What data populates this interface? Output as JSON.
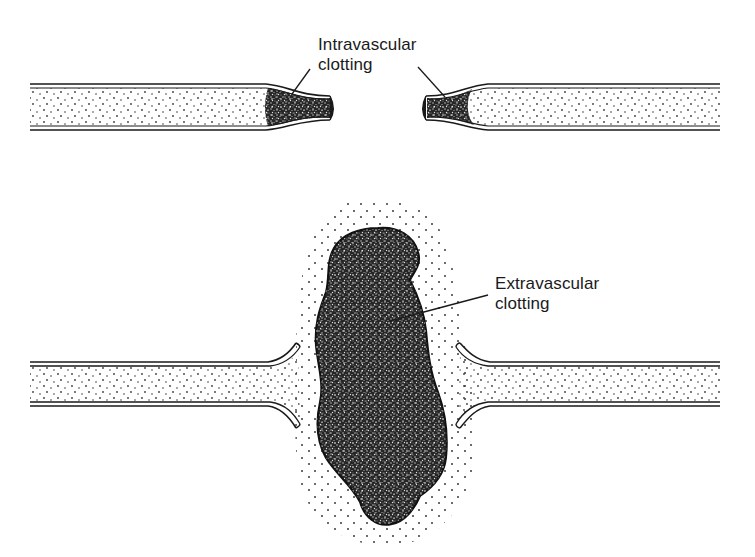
{
  "diagram": {
    "type": "medical-illustration",
    "colors": {
      "background": "#ffffff",
      "ink": "#1a1a1a",
      "clot_fill": "#2a2a2a",
      "stipple": "#444444"
    },
    "panels": [
      {
        "id": "top",
        "description": "Severed vessel with clots plugging each constricted end",
        "label": {
          "line1": "Intravascular",
          "line2": "clotting"
        }
      },
      {
        "id": "bottom",
        "description": "Severed vessel with large clot mass formed outside the vessel between the flared ends",
        "label": {
          "line1": "Extravascular",
          "line2": "clotting"
        }
      }
    ]
  }
}
